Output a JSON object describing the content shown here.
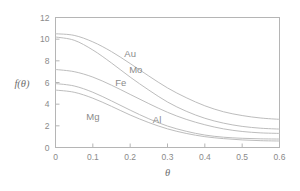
{
  "chart_data": {
    "type": "line",
    "title": "",
    "subtitle": "",
    "xlabel": "θ",
    "ylabel": "f(θ)",
    "xlim": [
      0,
      0.6
    ],
    "ylim": [
      0,
      12
    ],
    "xticks": [
      0,
      0.1,
      0.2,
      0.3,
      0.4,
      0.5,
      0.6
    ],
    "xtick_labels": [
      "0",
      "0.1",
      "0.2",
      "0.3",
      "0.4",
      "0.5",
      "0.6"
    ],
    "yticks": [
      0,
      2,
      4,
      6,
      8,
      10,
      12
    ],
    "ytick_labels": [
      "0",
      "2",
      "4",
      "6",
      "8",
      "10",
      "12"
    ],
    "grid": false,
    "legend_position": "inline-annotations",
    "line_color": "#bdbdbd",
    "axis_color": "#b5b5b5",
    "text_color": "#8a8a8a",
    "x": [
      0,
      0.05,
      0.1,
      0.15,
      0.2,
      0.25,
      0.3,
      0.35,
      0.4,
      0.45,
      0.5,
      0.55,
      0.6
    ],
    "series": [
      {
        "name": "Au",
        "label": "Au",
        "label_x": 0.2,
        "label_y": 8.35,
        "values": [
          10.5,
          10.35,
          9.75,
          8.85,
          7.75,
          6.6,
          5.5,
          4.6,
          3.85,
          3.3,
          2.95,
          2.72,
          2.6
        ]
      },
      {
        "name": "Mo",
        "label": "Mo",
        "label_x": 0.215,
        "label_y": 6.85,
        "values": [
          10.2,
          9.9,
          9.0,
          7.8,
          6.5,
          5.3,
          4.2,
          3.35,
          2.7,
          2.25,
          1.95,
          1.78,
          1.7
        ]
      },
      {
        "name": "Fe",
        "label": "Fe",
        "label_x": 0.175,
        "label_y": 5.65,
        "values": [
          7.2,
          7.0,
          6.5,
          5.75,
          4.9,
          4.05,
          3.25,
          2.6,
          2.1,
          1.72,
          1.48,
          1.35,
          1.3
        ]
      },
      {
        "name": "Al",
        "label": "Al",
        "label_x": 0.272,
        "label_y": 2.3,
        "values": [
          5.9,
          5.68,
          5.1,
          4.3,
          3.45,
          2.65,
          1.98,
          1.5,
          1.15,
          0.95,
          0.85,
          0.8,
          0.78
        ]
      },
      {
        "name": "Mg",
        "label": "Mg",
        "label_x": 0.1,
        "label_y": 2.55,
        "values": [
          5.3,
          5.1,
          4.55,
          3.8,
          3.0,
          2.3,
          1.72,
          1.3,
          1.0,
          0.82,
          0.7,
          0.63,
          0.6
        ]
      }
    ]
  }
}
